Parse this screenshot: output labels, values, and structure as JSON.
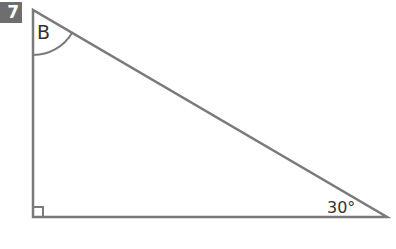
{
  "question": {
    "number": "7"
  },
  "diagram": {
    "type": "right-triangle",
    "vertex_label_top": "B",
    "angle_bottom_right": "30°",
    "right_angle_at": "bottom-left",
    "stroke_color": "#7a7a7a",
    "badge_color": "#6e6e6e"
  }
}
